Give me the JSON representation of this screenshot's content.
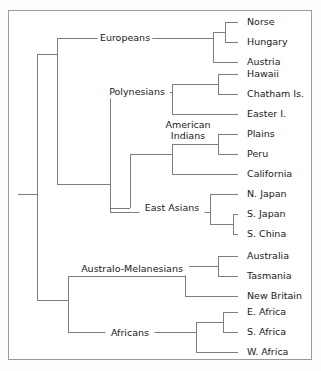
{
  "figure": {
    "type": "dendrogram",
    "title": "",
    "border_color": "#9a9a9a",
    "branch_color": "#7d7d7d",
    "text_color": "#1a1a1a",
    "background": "#ffffff"
  },
  "chart_data": {
    "type": "tree",
    "orientation": "left-to-right",
    "title": "",
    "xlabel": "",
    "ylabel": "",
    "grid": false,
    "legend": "none",
    "leaf_count": 18,
    "leaves": [
      {
        "label": "Norse",
        "y": 22,
        "x": 238
      },
      {
        "label": "Hungary",
        "y": 42,
        "x": 238
      },
      {
        "label": "Austria",
        "y": 62,
        "x": 238
      },
      {
        "label": "Hawaii",
        "y": 74,
        "x": 238
      },
      {
        "label": "Chatham Is.",
        "y": 94,
        "x": 238
      },
      {
        "label": "Easter I.",
        "y": 114,
        "x": 238
      },
      {
        "label": "Plains",
        "y": 134,
        "x": 238
      },
      {
        "label": "Peru",
        "y": 154,
        "x": 238
      },
      {
        "label": "California",
        "y": 174,
        "x": 238
      },
      {
        "label": "N. Japan",
        "y": 194,
        "x": 238
      },
      {
        "label": "S. Japan",
        "y": 214,
        "x": 238
      },
      {
        "label": "S. China",
        "y": 234,
        "x": 238
      },
      {
        "label": "Australia",
        "y": 256,
        "x": 238
      },
      {
        "label": "Tasmania",
        "y": 276,
        "x": 238
      },
      {
        "label": "New Britain",
        "y": 296,
        "x": 238
      },
      {
        "label": "E. Africa",
        "y": 312,
        "x": 238
      },
      {
        "label": "S. Africa",
        "y": 332,
        "x": 238
      },
      {
        "label": "W. Africa",
        "y": 352,
        "x": 238
      }
    ],
    "clade_labels": [
      {
        "label": "Europeans",
        "x": 125,
        "y": 38,
        "lines": [
          "Europeans"
        ]
      },
      {
        "label": "Polynesians",
        "x": 137,
        "y": 92,
        "lines": [
          "Polynesians"
        ]
      },
      {
        "label": "American Indians",
        "x": 188,
        "y": 130,
        "lines": [
          "American",
          "Indians"
        ]
      },
      {
        "label": "East Asians",
        "x": 172,
        "y": 208,
        "lines": [
          "East Asians"
        ]
      },
      {
        "label": "Australo-Melanesians",
        "x": 132,
        "y": 269,
        "lines": [
          "Australo-Melanesians"
        ]
      },
      {
        "label": "Africans",
        "x": 130,
        "y": 333,
        "lines": [
          "Africans"
        ]
      }
    ],
    "nodes": [
      {
        "name": "root",
        "x": 37,
        "children_y": [
          54,
          300
        ]
      },
      {
        "name": "eurasian-pacific",
        "x": 57,
        "children_y": [
          38,
          184
        ]
      },
      {
        "name": "europeans",
        "x": 213,
        "children_y": [
          32,
          62
        ]
      },
      {
        "name": "norse-hungary",
        "x": 225,
        "children_y": [
          22,
          42
        ]
      },
      {
        "name": "polynesian-amerind-ea",
        "x": 110,
        "children_y": [
          92,
          212
        ]
      },
      {
        "name": "polynesians",
        "x": 172,
        "children_y": [
          84,
          114
        ]
      },
      {
        "name": "hawaii-chatham",
        "x": 218,
        "children_y": [
          74,
          94
        ]
      },
      {
        "name": "amerind-eastasian",
        "x": 130,
        "children_y": [
          154,
          208
        ]
      },
      {
        "name": "american-indians",
        "x": 172,
        "children_y": [
          144,
          174
        ]
      },
      {
        "name": "plains-peru",
        "x": 218,
        "children_y": [
          134,
          154
        ]
      },
      {
        "name": "east-asians",
        "x": 210,
        "children_y": [
          194,
          224
        ]
      },
      {
        "name": "sjapan-schina",
        "x": 233,
        "children_y": [
          214,
          234
        ]
      },
      {
        "name": "australo-african",
        "x": 68,
        "children_y": [
          276,
          332
        ]
      },
      {
        "name": "australo-melanesians",
        "x": 185,
        "children_y": [
          266,
          296
        ]
      },
      {
        "name": "australia-tasmania",
        "x": 218,
        "children_y": [
          256,
          276
        ]
      },
      {
        "name": "africans",
        "x": 196,
        "children_y": [
          322,
          352
        ]
      },
      {
        "name": "eafrica-safrica",
        "x": 223,
        "children_y": [
          312,
          332
        ]
      }
    ],
    "branches": [
      {
        "from": "root-stem",
        "d": "M 18 194 L 37 194"
      },
      {
        "d": "M 37 54 L 37 300"
      },
      {
        "d": "M 37 54 L 57 54"
      },
      {
        "d": "M 37 300 L 68 300"
      },
      {
        "d": "M 57 38 L 57 184"
      },
      {
        "d": "M 57 38 L 213 38"
      },
      {
        "d": "M 57 184 L 110 184"
      },
      {
        "d": "M 213 32 L 213 62"
      },
      {
        "d": "M 213 32 L 225 32"
      },
      {
        "d": "M 213 62 L 238 62"
      },
      {
        "d": "M 225 22 L 225 42"
      },
      {
        "d": "M 225 22 L 238 22"
      },
      {
        "d": "M 225 42 L 238 42"
      },
      {
        "d": "M 110 92 L 110 212"
      },
      {
        "d": "M 110 92 L 172 92"
      },
      {
        "d": "M 110 212 L 210 212"
      },
      {
        "d": "M 172 84 L 172 114"
      },
      {
        "d": "M 172 84 L 218 84"
      },
      {
        "d": "M 172 114 L 238 114"
      },
      {
        "d": "M 218 74 L 218 94"
      },
      {
        "d": "M 218 74 L 238 74"
      },
      {
        "d": "M 218 94 L 238 94"
      },
      {
        "d": "M 130 154 L 130 208"
      },
      {
        "d": "M 130 154 L 172 154"
      },
      {
        "d": "M 130 208 L 110 208"
      },
      {
        "d": "M 172 144 L 172 174"
      },
      {
        "d": "M 172 144 L 218 144"
      },
      {
        "d": "M 172 174 L 238 174"
      },
      {
        "d": "M 218 134 L 218 154"
      },
      {
        "d": "M 218 134 L 238 134"
      },
      {
        "d": "M 218 154 L 238 154"
      },
      {
        "d": "M 210 194 L 210 224"
      },
      {
        "d": "M 210 194 L 238 194"
      },
      {
        "d": "M 210 224 L 233 224"
      },
      {
        "d": "M 233 214 L 233 234"
      },
      {
        "d": "M 233 214 L 238 214"
      },
      {
        "d": "M 233 234 L 238 234"
      },
      {
        "d": "M 68 276 L 68 332"
      },
      {
        "d": "M 68 276 L 185 276"
      },
      {
        "d": "M 68 332 L 196 332"
      },
      {
        "d": "M 185 266 L 185 296"
      },
      {
        "d": "M 185 266 L 218 266"
      },
      {
        "d": "M 185 296 L 238 296"
      },
      {
        "d": "M 218 256 L 218 276"
      },
      {
        "d": "M 218 256 L 238 256"
      },
      {
        "d": "M 218 276 L 238 276"
      },
      {
        "d": "M 196 322 L 196 352"
      },
      {
        "d": "M 196 322 L 223 322"
      },
      {
        "d": "M 196 352 L 238 352"
      },
      {
        "d": "M 223 312 L 223 332"
      },
      {
        "d": "M 223 312 L 238 312"
      },
      {
        "d": "M 223 332 L 238 332"
      }
    ]
  }
}
